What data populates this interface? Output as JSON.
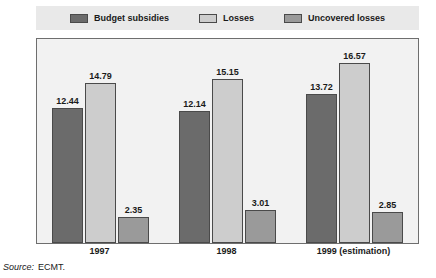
{
  "legend": {
    "position": "top-center",
    "entries": [
      {
        "label": "Budget subsidies",
        "color": "#6b6b6b",
        "swatch_name": "legend-swatch-budget-subsidies"
      },
      {
        "label": "Losses",
        "color": "#cdcdcd",
        "swatch_name": "legend-swatch-losses"
      },
      {
        "label": "Uncovered losses",
        "color": "#9a9a9a",
        "swatch_name": "legend-swatch-uncovered-losses"
      }
    ]
  },
  "source": {
    "label": "Source:",
    "value": "ECMT."
  },
  "chart_data": {
    "type": "bar",
    "title": "",
    "subtitle": "",
    "xlabel": "",
    "ylabel": "",
    "grid": false,
    "legend_position": "top-center",
    "ylim": [
      0,
      18.8
    ],
    "categories": [
      "1997",
      "1998",
      "1999 (estimation)"
    ],
    "series": [
      {
        "name": "Budget subsidies",
        "color": "#6b6b6b",
        "values": [
          12.44,
          12.14,
          13.72
        ]
      },
      {
        "name": "Losses",
        "color": "#cdcdcd",
        "values": [
          14.79,
          15.15,
          16.57
        ]
      },
      {
        "name": "Uncovered losses",
        "color": "#9a9a9a",
        "values": [
          2.35,
          3.01,
          2.85
        ]
      }
    ],
    "data_labels": [
      [
        "12.44",
        "14.79",
        "2.35"
      ],
      [
        "12.14",
        "15.15",
        "3.01"
      ],
      [
        "13.72",
        "16.57",
        "2.85"
      ]
    ]
  }
}
